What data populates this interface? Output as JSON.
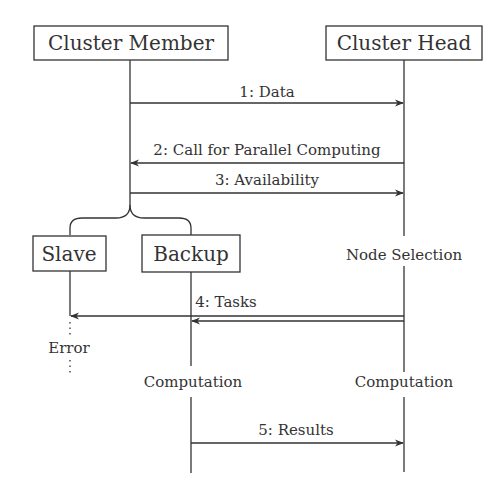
{
  "diagram": {
    "type": "sequence-diagram",
    "colors": {
      "line": "#333333",
      "background": "#ffffff",
      "text": "#333333"
    },
    "participants": [
      {
        "id": "member",
        "label": "Cluster Member"
      },
      {
        "id": "head",
        "label": "Cluster Head"
      },
      {
        "id": "slave",
        "label": "Slave"
      },
      {
        "id": "backup",
        "label": "Backup"
      }
    ],
    "messages": [
      {
        "label": "1: Data",
        "from": "Cluster Member",
        "to": "Cluster Head"
      },
      {
        "label": "2: Call for Parallel Computing",
        "from": "Cluster Head",
        "to": "Cluster Member"
      },
      {
        "label": "3: Availability",
        "from": "Cluster Member",
        "to": "Cluster Head"
      },
      {
        "label": "4: Tasks",
        "from": "Cluster Head",
        "to": "Slave, Backup"
      },
      {
        "label": "5: Results",
        "from": "Backup",
        "to": "Cluster Head"
      }
    ],
    "activities": {
      "head_selection": "Node Selection",
      "slave_state": "Error",
      "backup_computation": "Computation",
      "head_computation": "Computation"
    }
  }
}
